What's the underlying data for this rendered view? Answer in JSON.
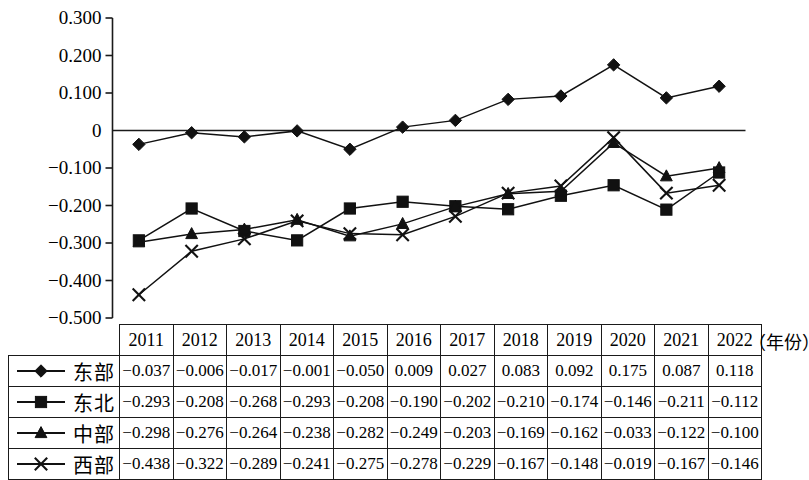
{
  "chart_data": {
    "type": "line",
    "title": "",
    "xlabel": "（年份）",
    "ylabel": "",
    "grid": false,
    "legend_position": "table-left",
    "ylim": [
      -0.5,
      0.3
    ],
    "yticks": [
      "0.300",
      "0.200",
      "0.100",
      "0",
      "−0.100",
      "−0.200",
      "−0.300",
      "−0.400",
      "−0.500"
    ],
    "ytick_values": [
      0.3,
      0.2,
      0.1,
      0,
      -0.1,
      -0.2,
      -0.3,
      -0.4,
      -0.5
    ],
    "categories": [
      "2011",
      "2012",
      "2013",
      "2014",
      "2015",
      "2016",
      "2017",
      "2018",
      "2019",
      "2020",
      "2021",
      "2022"
    ],
    "series": [
      {
        "name": "东部",
        "marker": "diamond",
        "values": [
          -0.037,
          -0.006,
          -0.017,
          -0.001,
          -0.05,
          0.009,
          0.027,
          0.083,
          0.092,
          0.175,
          0.087,
          0.118
        ],
        "labels": [
          "−0.037",
          "−0.006",
          "−0.017",
          "−0.001",
          "−0.050",
          "0.009",
          "0.027",
          "0.083",
          "0.092",
          "0.175",
          "0.087",
          "0.118"
        ]
      },
      {
        "name": "东北",
        "marker": "square",
        "values": [
          -0.293,
          -0.208,
          -0.268,
          -0.293,
          -0.208,
          -0.19,
          -0.202,
          -0.21,
          -0.174,
          -0.146,
          -0.211,
          -0.112
        ],
        "labels": [
          "−0.293",
          "−0.208",
          "−0.268",
          "−0.293",
          "−0.208",
          "−0.190",
          "−0.202",
          "−0.210",
          "−0.174",
          "−0.146",
          "−0.211",
          "−0.112"
        ]
      },
      {
        "name": "中部",
        "marker": "triangle",
        "values": [
          -0.298,
          -0.276,
          -0.264,
          -0.238,
          -0.282,
          -0.249,
          -0.203,
          -0.169,
          -0.162,
          -0.033,
          -0.122,
          -0.1
        ],
        "labels": [
          "−0.298",
          "−0.276",
          "−0.264",
          "−0.238",
          "−0.282",
          "−0.249",
          "−0.203",
          "−0.169",
          "−0.162",
          "−0.033",
          "−0.122",
          "−0.100"
        ]
      },
      {
        "name": "西部",
        "marker": "cross",
        "values": [
          -0.438,
          -0.322,
          -0.289,
          -0.241,
          -0.275,
          -0.278,
          -0.229,
          -0.167,
          -0.148,
          -0.019,
          -0.167,
          -0.146
        ],
        "labels": [
          "−0.438",
          "−0.322",
          "−0.289",
          "−0.241",
          "−0.275",
          "−0.278",
          "−0.229",
          "−0.167",
          "−0.148",
          "−0.019",
          "−0.167",
          "−0.146"
        ]
      }
    ],
    "colors": {
      "line": "#111111",
      "axis": "#1a1a1a",
      "background": "#ffffff"
    }
  },
  "table": {
    "year_header_label": "",
    "unit_label": "（年份）"
  }
}
